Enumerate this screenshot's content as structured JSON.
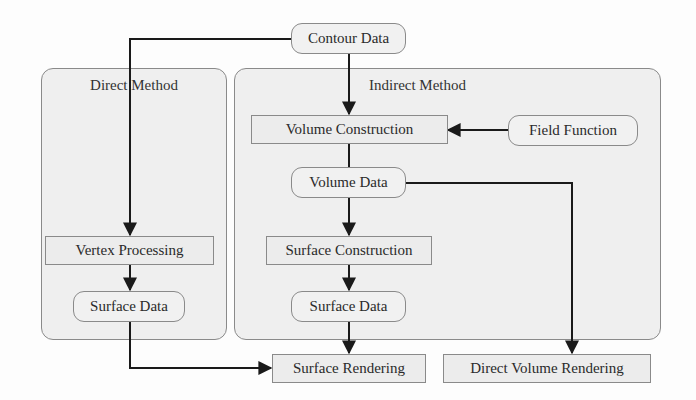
{
  "diagram": {
    "panels": {
      "direct": {
        "title": "Direct Method"
      },
      "indirect": {
        "title": "Indirect Method"
      }
    },
    "nodes": {
      "contour_data": "Contour Data",
      "volume_construction": "Volume Construction",
      "field_function": "Field Function",
      "volume_data": "Volume Data",
      "surface_construction": "Surface Construction",
      "surface_data_indirect": "Surface Data",
      "vertex_processing": "Vertex Processing",
      "surface_data_direct": "Surface Data",
      "surface_rendering": "Surface Rendering",
      "direct_volume_rendering": "Direct Volume Rendering"
    },
    "edges": [
      {
        "from": "Contour Data",
        "to": "Vertex Processing"
      },
      {
        "from": "Contour Data",
        "to": "Volume Construction"
      },
      {
        "from": "Field Function",
        "to": "Volume Construction"
      },
      {
        "from": "Volume Construction",
        "to": "Volume Data"
      },
      {
        "from": "Volume Data",
        "to": "Surface Construction"
      },
      {
        "from": "Volume Data",
        "to": "Direct Volume Rendering"
      },
      {
        "from": "Surface Construction",
        "to": "Surface Data"
      },
      {
        "from": "Surface Data",
        "to": "Surface Rendering"
      },
      {
        "from": "Vertex Processing",
        "to": "Surface Data"
      },
      {
        "from": "Surface Data (Direct)",
        "to": "Surface Rendering"
      }
    ],
    "colors": {
      "line": "#1a1a1a",
      "panel": "#efefef",
      "border": "#8a8a8a"
    }
  }
}
